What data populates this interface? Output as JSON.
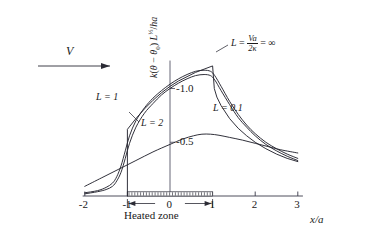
{
  "figure": {
    "ylabel_parts": {
      "k": "k(",
      "theta": "θ − θ",
      "sub0": "0",
      "close": ") L",
      "exp": "½",
      "tail": "/ha"
    },
    "ylabel_plain": "k(θ − θ0) L½/ha",
    "xlabel": "x/a",
    "flow_label": "V",
    "heated_zone_label": "Heated zone"
  },
  "curve_labels": {
    "inf_lhs": "L",
    "inf_eq": " = ",
    "inf_num": "Va",
    "inf_den": "2κ",
    "inf_tail": " = ∞",
    "l1": "L = 1",
    "l2": "L = 2",
    "l01": "L = 0.1"
  },
  "chart_data": {
    "type": "line",
    "title": "",
    "xlabel": "x/a",
    "ylabel": "k(θ − θ0) L½/ha",
    "xlim": [
      -2,
      3
    ],
    "ylim": [
      0,
      -1.25
    ],
    "grid": false,
    "legend": "inline-annotations",
    "xticks": [
      -2,
      -1,
      0,
      1,
      2,
      3
    ],
    "xticklabels": [
      "-2",
      "-1",
      "0",
      "1",
      "2",
      "3"
    ],
    "yticks": [
      -0.5,
      -1.0
    ],
    "yticklabels": [
      "-0.5",
      "-1.0"
    ],
    "annotations": [
      {
        "text": "L = Va/2κ = ∞",
        "x": 1.55,
        "y": -1.08
      },
      {
        "text": "L = 1",
        "x": -0.78,
        "y": -0.78
      },
      {
        "text": "L = 2",
        "x": -0.42,
        "y": -0.6
      },
      {
        "text": "L = 0.1",
        "x": 0.47,
        "y": -0.33
      },
      {
        "text": "V",
        "x": -1.52,
        "y": -1.06
      },
      {
        "text": "Heated zone",
        "x": -0.02,
        "y": 0.13
      }
    ],
    "heated_zone": {
      "from": -1,
      "to": 1
    },
    "series": [
      {
        "name": "L = ∞",
        "points": [
          [
            -1,
            0
          ],
          [
            -1,
            -0.62
          ],
          [
            -0.8,
            -0.72
          ],
          [
            -0.6,
            -0.81
          ],
          [
            -0.4,
            -0.89
          ],
          [
            -0.2,
            -0.96
          ],
          [
            0,
            -1.02
          ],
          [
            0.2,
            -1.07
          ],
          [
            0.4,
            -1.11
          ],
          [
            0.6,
            -1.15
          ],
          [
            0.8,
            -1.18
          ],
          [
            1,
            -1.21
          ],
          [
            1.04,
            -1.0
          ],
          [
            1.1,
            -0.92
          ],
          [
            1.2,
            -0.84
          ],
          [
            1.4,
            -0.72
          ],
          [
            1.6,
            -0.63
          ],
          [
            1.8,
            -0.56
          ],
          [
            2,
            -0.5
          ],
          [
            2.25,
            -0.44
          ],
          [
            2.5,
            -0.39
          ],
          [
            2.75,
            -0.35
          ],
          [
            3,
            -0.32
          ]
        ]
      },
      {
        "name": "L = 1",
        "points": [
          [
            -2,
            -0.03
          ],
          [
            -1.7,
            -0.05
          ],
          [
            -1.5,
            -0.08
          ],
          [
            -1.35,
            -0.12
          ],
          [
            -1.25,
            -0.18
          ],
          [
            -1.15,
            -0.28
          ],
          [
            -1.05,
            -0.42
          ],
          [
            -0.95,
            -0.56
          ],
          [
            -0.8,
            -0.7
          ],
          [
            -0.6,
            -0.82
          ],
          [
            -0.4,
            -0.91
          ],
          [
            -0.2,
            -0.98
          ],
          [
            0,
            -1.04
          ],
          [
            0.2,
            -1.09
          ],
          [
            0.4,
            -1.13
          ],
          [
            0.6,
            -1.16
          ],
          [
            0.8,
            -1.17
          ],
          [
            0.95,
            -1.16
          ],
          [
            1.05,
            -1.12
          ],
          [
            1.2,
            -1.02
          ],
          [
            1.4,
            -0.88
          ],
          [
            1.6,
            -0.76
          ],
          [
            1.8,
            -0.66
          ],
          [
            2,
            -0.58
          ],
          [
            2.25,
            -0.5
          ],
          [
            2.5,
            -0.44
          ],
          [
            2.75,
            -0.39
          ],
          [
            3,
            -0.35
          ]
        ]
      },
      {
        "name": "L = 2",
        "points": [
          [
            -2,
            -0.02
          ],
          [
            -1.7,
            -0.04
          ],
          [
            -1.5,
            -0.06
          ],
          [
            -1.35,
            -0.09
          ],
          [
            -1.25,
            -0.14
          ],
          [
            -1.15,
            -0.22
          ],
          [
            -1.05,
            -0.35
          ],
          [
            -0.95,
            -0.49
          ],
          [
            -0.8,
            -0.64
          ],
          [
            -0.6,
            -0.77
          ],
          [
            -0.4,
            -0.86
          ],
          [
            -0.2,
            -0.94
          ],
          [
            0,
            -1.0
          ],
          [
            0.2,
            -1.05
          ],
          [
            0.4,
            -1.09
          ],
          [
            0.6,
            -1.12
          ],
          [
            0.8,
            -1.13
          ],
          [
            0.95,
            -1.12
          ],
          [
            1.05,
            -1.08
          ],
          [
            1.2,
            -0.98
          ],
          [
            1.4,
            -0.85
          ],
          [
            1.6,
            -0.73
          ],
          [
            1.8,
            -0.64
          ],
          [
            2,
            -0.56
          ],
          [
            2.25,
            -0.48
          ],
          [
            2.5,
            -0.42
          ],
          [
            2.75,
            -0.37
          ],
          [
            3,
            -0.33
          ]
        ]
      },
      {
        "name": "L = 0.1",
        "points": [
          [
            -2,
            -0.09
          ],
          [
            -1.6,
            -0.17
          ],
          [
            -1.2,
            -0.25
          ],
          [
            -0.8,
            -0.33
          ],
          [
            -0.4,
            -0.41
          ],
          [
            0,
            -0.48
          ],
          [
            0.3,
            -0.53
          ],
          [
            0.55,
            -0.56
          ],
          [
            0.75,
            -0.575
          ],
          [
            0.95,
            -0.575
          ],
          [
            1.15,
            -0.565
          ],
          [
            1.4,
            -0.545
          ],
          [
            1.7,
            -0.52
          ],
          [
            2,
            -0.49
          ],
          [
            2.3,
            -0.46
          ],
          [
            2.6,
            -0.43
          ],
          [
            3,
            -0.4
          ]
        ]
      }
    ]
  }
}
